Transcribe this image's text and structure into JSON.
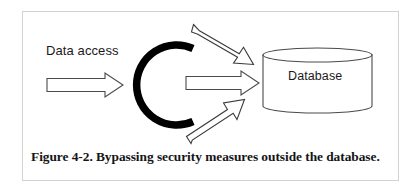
{
  "figure": {
    "caption": "Figure 4-2. Bypassing security measures outside the database.",
    "frame_border_color": "#d2d2d2",
    "background_color": "#ffffff"
  },
  "diagram": {
    "type": "security-bypass-flow",
    "labels": {
      "data_access": "Data access",
      "database": "Database"
    },
    "colors": {
      "outline": "#2b2b2b",
      "barrier": "#000000",
      "fill": "#ffffff",
      "text": "#1a1a1a"
    },
    "elements": [
      {
        "name": "data-access-arrow",
        "kind": "block-arrow",
        "direction": "right",
        "from": [
          47,
          85
        ],
        "to": [
          123,
          85
        ],
        "description": "Legitimate data access path pointing toward the security barrier"
      },
      {
        "name": "security-barrier-arc",
        "kind": "arc",
        "shape": "c-open-right",
        "center": [
          196,
          85
        ],
        "radius": 42,
        "thickness": 7,
        "description": "Thick black arc representing the security measure"
      },
      {
        "name": "bypass-arrow-top",
        "kind": "block-arrow",
        "direction": "down-right",
        "from": [
          194,
          26
        ],
        "to": [
          253,
          63
        ],
        "description": "Bypass path entering the database from above the barrier"
      },
      {
        "name": "through-arrow-middle",
        "kind": "block-arrow",
        "direction": "right",
        "from": [
          186,
          83
        ],
        "to": [
          259,
          83
        ],
        "description": "Access path passing through the barrier opening into the database"
      },
      {
        "name": "bypass-arrow-bottom",
        "kind": "block-arrow",
        "direction": "up-right",
        "from": [
          192,
          142
        ],
        "to": [
          254,
          101
        ],
        "description": "Bypass path entering the database from below the barrier"
      },
      {
        "name": "database-cylinder",
        "kind": "cylinder",
        "bounds": [
          263,
          48,
          109,
          65
        ],
        "ellipse_ry": 7,
        "description": "Database represented as a 3D cylinder"
      }
    ]
  }
}
